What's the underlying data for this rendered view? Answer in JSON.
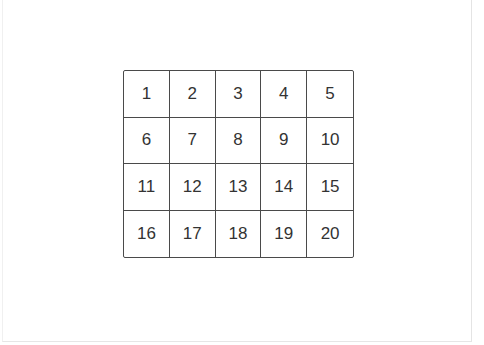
{
  "grid": {
    "rows": 4,
    "columns": 5,
    "cells": [
      [
        "1",
        "2",
        "3",
        "4",
        "5"
      ],
      [
        "6",
        "7",
        "8",
        "9",
        "10"
      ],
      [
        "11",
        "12",
        "13",
        "14",
        "15"
      ],
      [
        "16",
        "17",
        "18",
        "19",
        "20"
      ]
    ]
  },
  "colors": {
    "line": "#4a4a4a",
    "text": "#333333",
    "background": "#ffffff"
  }
}
